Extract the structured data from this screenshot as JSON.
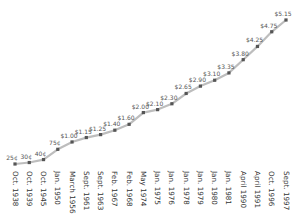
{
  "chart_data": {
    "type": "line",
    "title": "",
    "xlabel": "",
    "ylabel": "",
    "grid": false,
    "legend": null,
    "categories": [
      "Oct. 1938",
      "Oct. 1939",
      "Oct. 1945",
      "Jan. 1950",
      "March 1956",
      "Sept. 1961",
      "Sept. 1963",
      "Feb. 1967",
      "Feb. 1968",
      "May 1974",
      "Jan. 1975",
      "Jan. 1976",
      "Jan. 1978",
      "Jan. 1979",
      "Jan. 1980",
      "Jan. 1981",
      "April 1990",
      "April 1991",
      "Oct. 1996",
      "Sept. 1997"
    ],
    "values": [
      0.25,
      0.3,
      0.4,
      0.75,
      1.0,
      1.15,
      1.25,
      1.4,
      1.6,
      2.0,
      2.1,
      2.3,
      2.65,
      2.9,
      3.1,
      3.35,
      3.8,
      4.25,
      4.75,
      5.15
    ],
    "data_labels": [
      "25¢",
      "30¢",
      "40¢",
      "75¢",
      "$1.00",
      "$1.15",
      "$1.25",
      "$1.40",
      "$1.60",
      "$2.00",
      "$2.10",
      "$2.30",
      "$2.65",
      "$2.90",
      "$3.10",
      "$3.35",
      "$3.80",
      "$4.25",
      "$4.75",
      "$5.15"
    ],
    "ylim": [
      0,
      5.5
    ],
    "colors": {
      "line": "#bdbdbd",
      "marker": "#555555",
      "label": "#555555",
      "tick": "#333333"
    }
  }
}
